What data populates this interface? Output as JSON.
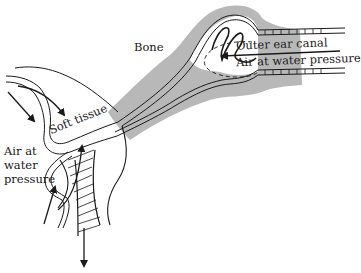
{
  "diagram": {
    "labels": {
      "bone": "Bone",
      "outer_ear_canal": "Outer ear canal",
      "air_water_pressure_canal": "Air at water pressure",
      "soft_tissue": "Soft tissue",
      "air_water_pressure_left_line1": "Air at",
      "air_water_pressure_left_line2": "water",
      "air_water_pressure_left_line3": "pressure"
    },
    "colors": {
      "bone_fill": "#b8b8b8",
      "line": "#1a1a1a",
      "background": "#ffffff"
    }
  }
}
